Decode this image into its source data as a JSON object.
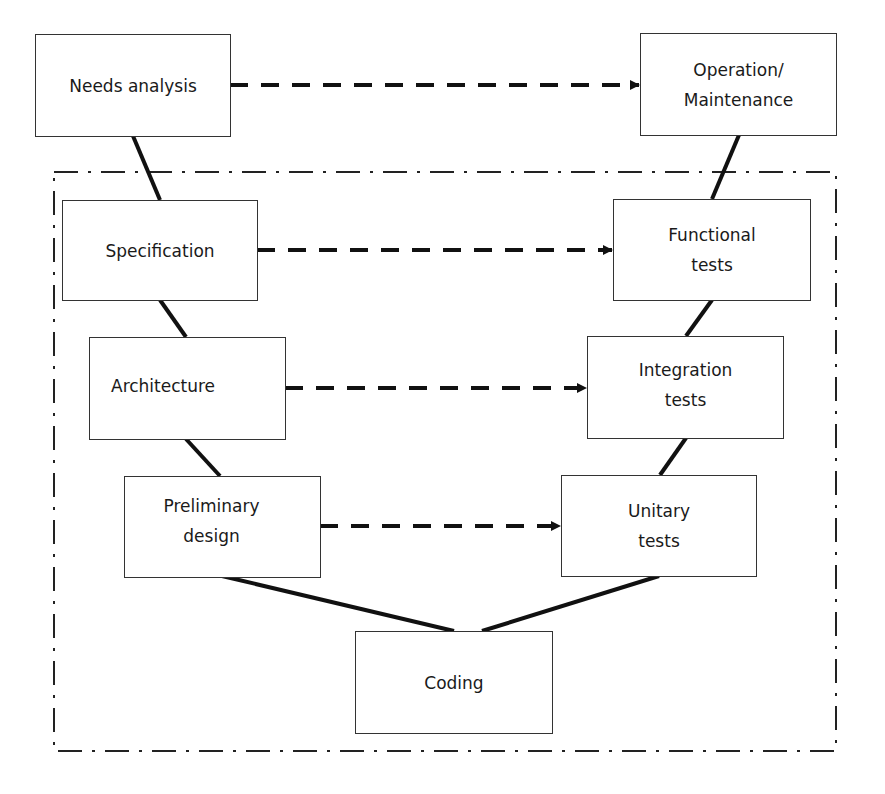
{
  "diagram": {
    "type": "V-model lifecycle",
    "nodes": [
      {
        "id": "needs",
        "label_lines": [
          "Needs analysis"
        ]
      },
      {
        "id": "operation",
        "label_lines": [
          "Operation/",
          "Maintenance"
        ]
      },
      {
        "id": "specification",
        "label_lines": [
          "Specification"
        ]
      },
      {
        "id": "functional",
        "label_lines": [
          "Functional",
          "tests"
        ]
      },
      {
        "id": "architecture",
        "label_lines": [
          "Architecture"
        ]
      },
      {
        "id": "integration",
        "label_lines": [
          "Integration",
          "tests"
        ]
      },
      {
        "id": "preliminary",
        "label_lines": [
          "Preliminary",
          "design"
        ]
      },
      {
        "id": "unitary",
        "label_lines": [
          "Unitary",
          "tests"
        ]
      },
      {
        "id": "coding",
        "label_lines": [
          "Coding"
        ]
      }
    ],
    "solid_links": [
      [
        "needs",
        "specification"
      ],
      [
        "specification",
        "architecture"
      ],
      [
        "architecture",
        "preliminary"
      ],
      [
        "preliminary",
        "coding"
      ],
      [
        "coding",
        "unitary"
      ],
      [
        "unitary",
        "integration"
      ],
      [
        "integration",
        "functional"
      ],
      [
        "functional",
        "operation"
      ]
    ],
    "dashed_arrows": [
      [
        "needs",
        "operation"
      ],
      [
        "specification",
        "functional"
      ],
      [
        "architecture",
        "integration"
      ],
      [
        "preliminary",
        "unitary"
      ]
    ],
    "frame": {
      "style": "dash-dot",
      "encloses": [
        "specification",
        "functional",
        "architecture",
        "integration",
        "preliminary",
        "unitary",
        "coding"
      ]
    }
  }
}
